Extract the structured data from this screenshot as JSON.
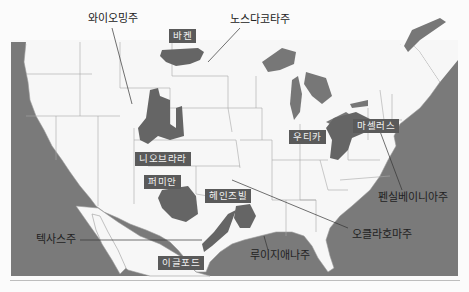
{
  "map": {
    "colors": {
      "background": "#fbfbfb",
      "land": "#f7f7f7",
      "water": "#7a7a7a",
      "shale": "#656565",
      "border": "#9a9a9a",
      "label_bg": "#5a5a5a",
      "label_text": "#f2f2f2",
      "text": "#222222"
    },
    "state_labels": [
      {
        "id": "wyoming",
        "text": "와이오밍주"
      },
      {
        "id": "north-dakota",
        "text": "노스다코타주"
      },
      {
        "id": "pennsylvania",
        "text": "펜실베이니아주"
      },
      {
        "id": "oklahoma",
        "text": "오클라호마주"
      },
      {
        "id": "texas",
        "text": "텍사스주"
      },
      {
        "id": "louisiana",
        "text": "루이지애나주"
      }
    ],
    "shale_plays": [
      {
        "id": "bakken",
        "text": "바켄"
      },
      {
        "id": "marcellus",
        "text": "마셀러스"
      },
      {
        "id": "utica",
        "text": "우티카"
      },
      {
        "id": "niobrara",
        "text": "니오브라라"
      },
      {
        "id": "permian",
        "text": "퍼미안"
      },
      {
        "id": "haynesville",
        "text": "헤인즈빌"
      },
      {
        "id": "eagle-ford",
        "text": "이글포드"
      }
    ]
  }
}
